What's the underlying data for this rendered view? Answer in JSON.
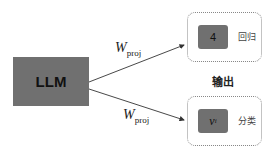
{
  "llm": {
    "label": "LLM"
  },
  "arrows": [
    {
      "label_main": "W",
      "label_sub": "proj"
    },
    {
      "label_main": "W",
      "label_sub": "proj"
    }
  ],
  "output_title": "输出",
  "outputs": [
    {
      "value": "4",
      "label": "回归"
    },
    {
      "value_main": "v",
      "value_sub": "i",
      "label": "分类"
    }
  ],
  "colors": {
    "box_fill": "#707070",
    "dotted_border": "#888888",
    "arrow": "#333333"
  }
}
